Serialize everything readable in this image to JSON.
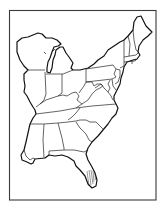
{
  "map": {
    "subject": "Outline map of the eastern United States",
    "labels": [],
    "colors": {
      "background": "#ffffff",
      "frame": "#3a3a3a",
      "outline": "#111111",
      "borders": "#222222"
    },
    "features": {
      "frame": "rectangular border",
      "hatching": "Florida wetland hatching lines"
    },
    "regions": [
      "Wisconsin",
      "Michigan",
      "Illinois",
      "Indiana",
      "Ohio",
      "Kentucky",
      "Tennessee",
      "Mississippi",
      "Alabama",
      "Georgia",
      "Florida",
      "South Carolina",
      "North Carolina",
      "Virginia",
      "West Virginia",
      "Maryland",
      "Delaware",
      "New Jersey",
      "Pennsylvania",
      "New York",
      "Connecticut",
      "Rhode Island",
      "Massachusetts",
      "Vermont",
      "New Hampshire",
      "Maine"
    ]
  }
}
